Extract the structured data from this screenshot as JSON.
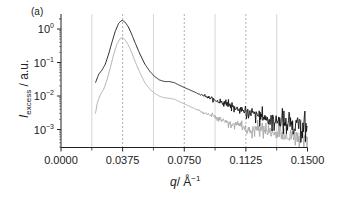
{
  "chart_data": {
    "type": "line",
    "panel_label": "(a)",
    "title": "",
    "xlabel": "q/ Å⁻¹",
    "xlabel_main": "q",
    "xlabel_unit": "/ Å",
    "xlabel_sup": "−1",
    "ylabel": "I_excess / a.u.",
    "ylabel_main": "I",
    "ylabel_sub": "excess",
    "ylabel_unit": " / a.u.",
    "xlim": [
      0.0,
      0.15
    ],
    "ylim": [
      0.0004,
      3.0
    ],
    "yscale": "log",
    "x_ticks": [
      "0.0000",
      "0.0375",
      "0.0750",
      "0.1125",
      "0.1500"
    ],
    "x_tick_values": [
      0.0,
      0.0375,
      0.075,
      0.1125,
      0.15
    ],
    "y_ticks": [
      {
        "base": "10",
        "exp": "0",
        "value": 1
      },
      {
        "base": "10",
        "exp": "−1",
        "value": 0.1
      },
      {
        "base": "10",
        "exp": "−2",
        "value": 0.01
      },
      {
        "base": "10",
        "exp": "−3",
        "value": 0.001
      }
    ],
    "reference_lines": {
      "solid_gray_q": [
        0.01875,
        0.05625,
        0.09375,
        0.13125
      ],
      "dashed_q": [
        0.0375,
        0.075,
        0.1125
      ]
    },
    "legend": "none",
    "grid": false,
    "series": [
      {
        "name": "black curve",
        "color": "#111111",
        "x": [
          0.021,
          0.023,
          0.025,
          0.027,
          0.029,
          0.031,
          0.033,
          0.035,
          0.0365,
          0.0375,
          0.039,
          0.041,
          0.043,
          0.045,
          0.048,
          0.051,
          0.054,
          0.057,
          0.06,
          0.063,
          0.066,
          0.069,
          0.072,
          0.075,
          0.08,
          0.085,
          0.09,
          0.095,
          0.1,
          0.105,
          0.11,
          0.115,
          0.12,
          0.125,
          0.13,
          0.135,
          0.14,
          0.145,
          0.15
        ],
        "y": [
          0.025,
          0.045,
          0.06,
          0.09,
          0.18,
          0.4,
          0.85,
          1.45,
          1.75,
          1.8,
          1.6,
          1.15,
          0.7,
          0.4,
          0.18,
          0.09,
          0.055,
          0.038,
          0.03,
          0.027,
          0.027,
          0.025,
          0.021,
          0.018,
          0.014,
          0.011,
          0.0088,
          0.0072,
          0.0058,
          0.0047,
          0.0038,
          0.0031,
          0.0026,
          0.0022,
          0.0019,
          0.0017,
          0.0015,
          0.0013,
          0.0012
        ]
      },
      {
        "name": "gray curve",
        "color": "#a8a8a8",
        "x": [
          0.021,
          0.022,
          0.024,
          0.026,
          0.028,
          0.03,
          0.032,
          0.034,
          0.036,
          0.0375,
          0.039,
          0.041,
          0.043,
          0.045,
          0.048,
          0.051,
          0.054,
          0.057,
          0.06,
          0.063,
          0.066,
          0.069,
          0.072,
          0.075,
          0.08,
          0.085,
          0.09,
          0.095,
          0.1,
          0.105,
          0.11,
          0.115,
          0.12,
          0.125,
          0.13,
          0.135,
          0.14,
          0.145,
          0.15
        ],
        "y": [
          0.003,
          0.006,
          0.011,
          0.016,
          0.03,
          0.07,
          0.17,
          0.35,
          0.52,
          0.55,
          0.48,
          0.33,
          0.2,
          0.11,
          0.05,
          0.025,
          0.016,
          0.012,
          0.0098,
          0.0088,
          0.0085,
          0.008,
          0.0068,
          0.0058,
          0.0045,
          0.0035,
          0.0028,
          0.0023,
          0.0018,
          0.0015,
          0.0012,
          0.00095,
          0.0011,
          0.0009,
          0.0008,
          0.00075,
          0.0007,
          0.00065,
          0.0006
        ]
      }
    ]
  }
}
